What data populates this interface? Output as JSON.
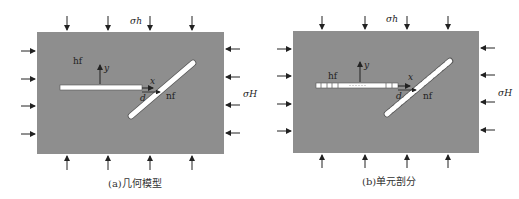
{
  "colors": {
    "matrix": "#8e8e8e",
    "fracture": "#ffffff",
    "line": "#222222",
    "caption": "#333333"
  },
  "panels": [
    {
      "id": "a",
      "caption": "(a)几何模型",
      "labels": {
        "sigma_h": "σh",
        "sigma_H": "σH",
        "hf": "hf",
        "nf": "nf",
        "x": "x",
        "y": "y",
        "d": "d"
      },
      "meshed": false
    },
    {
      "id": "b",
      "caption": "(b)单元剖分",
      "labels": {
        "sigma_h": "σh",
        "sigma_H": "σH",
        "hf": "hf",
        "nf": "nf",
        "x": "x",
        "y": "y",
        "d": "d"
      },
      "meshed": true
    }
  ]
}
